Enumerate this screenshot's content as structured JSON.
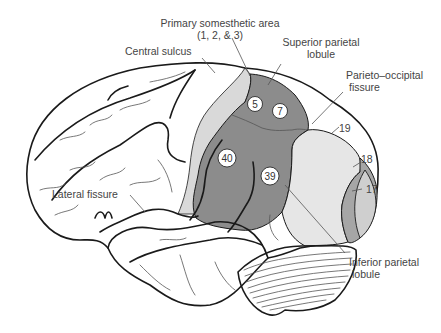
{
  "figure": {
    "labels": {
      "primary_somesthetic": "Primary somesthetic area",
      "primary_somesthetic_sub": "(1, 2, & 3)",
      "central_sulcus": "Central sulcus",
      "superior_parietal_1": "Superior parietal",
      "superior_parietal_2": "lobule",
      "parieto_occipital_1": "Parieto–occipital",
      "parieto_occipital_2": "fissure",
      "lateral_fissure": "Lateral fissure",
      "inferior_parietal_1": "Inferior parietal",
      "inferior_parietal_2": "lobule"
    },
    "areas": {
      "a5": "5",
      "a7": "7",
      "a40": "40",
      "a39": "39",
      "a19": "19",
      "a18": "18",
      "a17": "17"
    },
    "colors": {
      "primary_area_fill": "#d9d9d9",
      "association_fill": "#8c8c8c",
      "area19_fill": "#e6e6e6",
      "area18_fill": "#a6a6a6",
      "area17_fill": "#cfcfcf",
      "outline": "#1a1a1a"
    }
  }
}
